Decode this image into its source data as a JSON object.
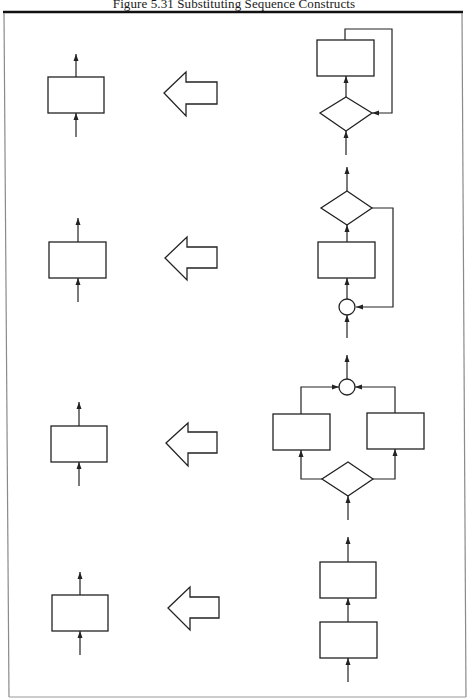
{
  "figure": {
    "title": "Figure 5.31  Substituting Sequence Constructs",
    "colors": {
      "ink": "#222222",
      "background": "#ffffff",
      "frame": "#8a8a8a"
    }
  },
  "rows": [
    {
      "id": "row-1",
      "left": "single process block",
      "arrow": "replaced-by arrow (left)",
      "right": "while-loop construct: decision diamond feeding process block with loop-back line"
    },
    {
      "id": "row-2",
      "left": "single process block",
      "arrow": "replaced-by arrow (left)",
      "right": "repeat-until construct: junction circle, process block, decision diamond with loop-back line"
    },
    {
      "id": "row-3",
      "left": "single process block",
      "arrow": "replaced-by arrow (left)",
      "right": "if-then-else construct: decision diamond branching to two process blocks merging into junction circle"
    },
    {
      "id": "row-4",
      "left": "single process block",
      "arrow": "replaced-by arrow (left)",
      "right": "sequence construct: two process blocks in series"
    }
  ]
}
